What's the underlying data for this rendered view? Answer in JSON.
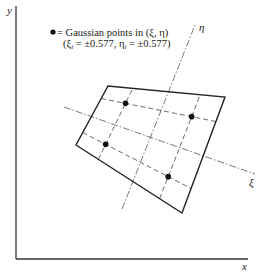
{
  "figure": {
    "axes": {
      "x_label": "x",
      "y_label": "y"
    },
    "natural_axes": {
      "xi_label": "ξ",
      "eta_label": "η"
    },
    "legend": {
      "line1": "= Gaussian points in (ξ, η)",
      "line2_prefix": "(ξ",
      "line2_sub_i": "i",
      "line2_mid": " = ±0.577, η",
      "line2_sub_i2": "i",
      "line2_suffix": " = ±0.577)",
      "marker": "filled-circle"
    },
    "element": {
      "type": "quadrilateral",
      "gauss_coordinate": 0.577,
      "grid_natural_lines": [
        -0.577,
        0,
        0.577
      ],
      "gauss_points": [
        {
          "xi": -0.577,
          "eta": -0.577
        },
        {
          "xi": 0.577,
          "eta": -0.577
        },
        {
          "xi": 0.577,
          "eta": 0.577
        },
        {
          "xi": -0.577,
          "eta": 0.577
        }
      ]
    },
    "colors": {
      "line": "#222222",
      "background": "#ffffff"
    }
  }
}
